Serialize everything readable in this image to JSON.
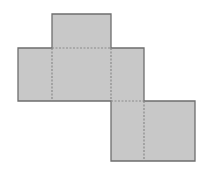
{
  "diagram": {
    "type": "cuboid-net",
    "colors": {
      "fill": "#c8c8c8",
      "stroke": "#6e6e6e",
      "fold": "#8a8a8a",
      "background": "#ffffff"
    },
    "faces": [
      {
        "id": "top",
        "x": 52,
        "y": 14,
        "w": 59,
        "h": 34
      },
      {
        "id": "left",
        "x": 18,
        "y": 48,
        "w": 34,
        "h": 53
      },
      {
        "id": "front",
        "x": 52,
        "y": 48,
        "w": 59,
        "h": 53
      },
      {
        "id": "right",
        "x": 111,
        "y": 48,
        "w": 33,
        "h": 53
      },
      {
        "id": "bottom-left",
        "x": 111,
        "y": 101,
        "w": 33,
        "h": 60
      },
      {
        "id": "bottom-right",
        "x": 144,
        "y": 101,
        "w": 51,
        "h": 60
      }
    ],
    "outline": "52,14 111,14 111,48 144,48 144,101 195,101 195,161 111,161 111,101 18,101 18,48 52,48",
    "fold_lines": [
      {
        "x1": 52,
        "y1": 48,
        "x2": 111,
        "y2": 48
      },
      {
        "x1": 52,
        "y1": 48,
        "x2": 52,
        "y2": 101
      },
      {
        "x1": 111,
        "y1": 48,
        "x2": 111,
        "y2": 101
      },
      {
        "x1": 111,
        "y1": 101,
        "x2": 144,
        "y2": 101
      },
      {
        "x1": 144,
        "y1": 101,
        "x2": 144,
        "y2": 161
      }
    ]
  }
}
